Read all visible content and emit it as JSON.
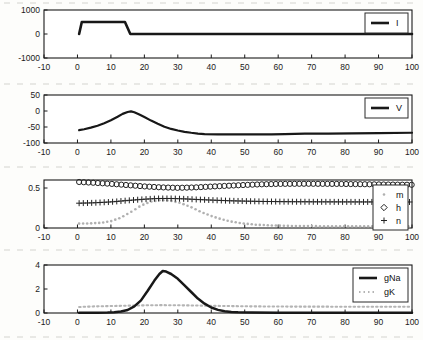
{
  "figure": {
    "background": "#fdfdfb",
    "axis_color": "#1a1a1a",
    "line_color": "#181818",
    "gray_color": "#b0b0b0",
    "tick_font_px": 8.5,
    "legend_font_px": 9
  },
  "chart_data": [
    {
      "id": "current",
      "type": "line",
      "title": "",
      "xlabel": "",
      "ylabel": "",
      "xlim": [
        -10,
        100
      ],
      "ylim": [
        -1000,
        1000
      ],
      "xticks": [
        -10,
        0,
        10,
        20,
        30,
        40,
        50,
        60,
        70,
        80,
        90,
        100
      ],
      "yticks": [
        -1000,
        0,
        1000
      ],
      "grid": false,
      "legend": {
        "position": "top-right",
        "entries": [
          {
            "label": "I",
            "swatch": "line",
            "color": "#181818"
          }
        ]
      },
      "series": [
        {
          "name": "I",
          "style": "line",
          "color": "#181818",
          "width": 2.6,
          "points": [
            [
              0.5,
              0
            ],
            [
              1.3,
              500
            ],
            [
              14.2,
              500
            ],
            [
              15.8,
              0
            ],
            [
              100,
              0
            ]
          ]
        }
      ]
    },
    {
      "id": "voltage",
      "type": "line",
      "title": "",
      "xlabel": "",
      "ylabel": "",
      "xlim": [
        -10,
        100
      ],
      "ylim": [
        -100,
        50
      ],
      "xticks": [
        -10,
        0,
        10,
        20,
        30,
        40,
        50,
        60,
        70,
        80,
        90,
        100
      ],
      "yticks": [
        -100,
        -50,
        0,
        50
      ],
      "grid": false,
      "legend": {
        "position": "top-right",
        "entries": [
          {
            "label": "V",
            "swatch": "line",
            "color": "#181818"
          }
        ]
      },
      "series": [
        {
          "name": "V",
          "style": "line",
          "color": "#181818",
          "width": 2.2,
          "points": [
            [
              0.5,
              -60
            ],
            [
              2,
              -57
            ],
            [
              4,
              -52
            ],
            [
              6,
              -46
            ],
            [
              8,
              -38
            ],
            [
              10,
              -29
            ],
            [
              12,
              -18
            ],
            [
              13.5,
              -9
            ],
            [
              15,
              -3
            ],
            [
              16,
              -1
            ],
            [
              17,
              -4
            ],
            [
              18.5,
              -11
            ],
            [
              20,
              -19
            ],
            [
              22,
              -30
            ],
            [
              24,
              -40
            ],
            [
              26,
              -49
            ],
            [
              28,
              -56
            ],
            [
              30,
              -61
            ],
            [
              32,
              -65
            ],
            [
              34,
              -68
            ],
            [
              36,
              -70.5
            ],
            [
              38,
              -72
            ],
            [
              42,
              -73
            ],
            [
              50,
              -73
            ],
            [
              58,
              -73
            ],
            [
              62,
              -72
            ],
            [
              68,
              -71
            ],
            [
              75,
              -70.5
            ],
            [
              82,
              -70
            ],
            [
              90,
              -69
            ],
            [
              100,
              -68
            ]
          ]
        }
      ]
    },
    {
      "id": "gates",
      "type": "scatter",
      "title": "",
      "xlabel": "",
      "ylabel": "",
      "xlim": [
        -10,
        100
      ],
      "ylim": [
        0,
        0.6
      ],
      "xticks": [
        -10,
        0,
        10,
        20,
        30,
        40,
        50,
        60,
        70,
        80,
        90,
        100
      ],
      "yticks": [
        0,
        0.5
      ],
      "grid": false,
      "legend": {
        "position": "mid-right",
        "entries": [
          {
            "label": "m",
            "swatch": "dot",
            "color": "#b0b0b0"
          },
          {
            "label": "h",
            "swatch": "diamond",
            "color": "#222222"
          },
          {
            "label": "n",
            "swatch": "plus",
            "color": "#222222"
          }
        ]
      },
      "series": [
        {
          "name": "m",
          "style": "marker",
          "marker": "dot",
          "color": "#b0b0b0",
          "step": 1.2,
          "anchors": [
            [
              0.5,
              0.055
            ],
            [
              4,
              0.058
            ],
            [
              7,
              0.065
            ],
            [
              10,
              0.085
            ],
            [
              13,
              0.13
            ],
            [
              16,
              0.2
            ],
            [
              19,
              0.28
            ],
            [
              22,
              0.33
            ],
            [
              25,
              0.35
            ],
            [
              28,
              0.34
            ],
            [
              31,
              0.31
            ],
            [
              34,
              0.26
            ],
            [
              37,
              0.2
            ],
            [
              40,
              0.15
            ],
            [
              43,
              0.11
            ],
            [
              46,
              0.08
            ],
            [
              49,
              0.06
            ],
            [
              53,
              0.042
            ],
            [
              58,
              0.032
            ],
            [
              65,
              0.025
            ],
            [
              75,
              0.022
            ],
            [
              100,
              0.02
            ]
          ]
        },
        {
          "name": "n",
          "style": "marker",
          "marker": "plus",
          "color": "#222222",
          "step": 1.25,
          "anchors": [
            [
              0.5,
              0.31
            ],
            [
              5,
              0.315
            ],
            [
              10,
              0.326
            ],
            [
              15,
              0.344
            ],
            [
              20,
              0.36
            ],
            [
              24,
              0.369
            ],
            [
              28,
              0.369
            ],
            [
              32,
              0.364
            ],
            [
              36,
              0.356
            ],
            [
              40,
              0.349
            ],
            [
              45,
              0.341
            ],
            [
              50,
              0.336
            ],
            [
              55,
              0.332
            ],
            [
              62,
              0.329
            ],
            [
              72,
              0.327
            ],
            [
              85,
              0.326
            ],
            [
              100,
              0.325
            ]
          ]
        },
        {
          "name": "h",
          "style": "marker",
          "marker": "circle",
          "color": "#222222",
          "step": 1.4,
          "anchors": [
            [
              0.5,
              0.575
            ],
            [
              5,
              0.565
            ],
            [
              10,
              0.552
            ],
            [
              15,
              0.536
            ],
            [
              20,
              0.52
            ],
            [
              25,
              0.508
            ],
            [
              30,
              0.502
            ],
            [
              35,
              0.507
            ],
            [
              40,
              0.518
            ],
            [
              45,
              0.528
            ],
            [
              50,
              0.538
            ],
            [
              55,
              0.546
            ],
            [
              60,
              0.551
            ],
            [
              68,
              0.553
            ],
            [
              78,
              0.551
            ],
            [
              88,
              0.546
            ],
            [
              100,
              0.54
            ]
          ]
        }
      ]
    },
    {
      "id": "conductances",
      "type": "line",
      "title": "",
      "xlabel": "",
      "ylabel": "",
      "xlim": [
        -10,
        100
      ],
      "ylim": [
        0,
        4
      ],
      "xticks": [
        -10,
        0,
        10,
        20,
        30,
        40,
        50,
        60,
        70,
        80,
        90,
        100
      ],
      "yticks": [
        0,
        2,
        4
      ],
      "grid": false,
      "legend": {
        "position": "top-right",
        "entries": [
          {
            "label": "gNa",
            "swatch": "line",
            "color": "#181818"
          },
          {
            "label": "gK",
            "swatch": "dotline",
            "color": "#b4b4b4"
          }
        ]
      },
      "series": [
        {
          "name": "gK",
          "style": "line",
          "color": "#b4b4b4",
          "width": 2.1,
          "dash": "1.5 3",
          "points": [
            [
              0.5,
              0.5
            ],
            [
              5,
              0.55
            ],
            [
              10,
              0.58
            ],
            [
              15,
              0.61
            ],
            [
              20,
              0.64
            ],
            [
              25,
              0.655
            ],
            [
              30,
              0.645
            ],
            [
              35,
              0.625
            ],
            [
              40,
              0.6
            ],
            [
              45,
              0.58
            ],
            [
              50,
              0.56
            ],
            [
              58,
              0.54
            ],
            [
              68,
              0.53
            ],
            [
              80,
              0.525
            ],
            [
              100,
              0.52
            ]
          ]
        },
        {
          "name": "gNa",
          "style": "line",
          "color": "#181818",
          "width": 2.5,
          "points": [
            [
              0.5,
              0.03
            ],
            [
              6,
              0.03
            ],
            [
              9,
              0.04
            ],
            [
              11,
              0.07
            ],
            [
              13,
              0.12
            ],
            [
              15,
              0.25
            ],
            [
              17,
              0.55
            ],
            [
              19,
              1.05
            ],
            [
              21,
              1.85
            ],
            [
              23,
              2.7
            ],
            [
              24.5,
              3.25
            ],
            [
              25.5,
              3.5
            ],
            [
              26.5,
              3.45
            ],
            [
              28,
              3.25
            ],
            [
              30,
              2.85
            ],
            [
              32,
              2.3
            ],
            [
              34,
              1.75
            ],
            [
              36,
              1.2
            ],
            [
              38,
              0.78
            ],
            [
              40,
              0.46
            ],
            [
              42,
              0.26
            ],
            [
              44,
              0.15
            ],
            [
              46,
              0.09
            ],
            [
              48,
              0.06
            ],
            [
              52,
              0.04
            ],
            [
              60,
              0.03
            ],
            [
              75,
              0.025
            ],
            [
              100,
              0.02
            ]
          ]
        }
      ]
    }
  ]
}
